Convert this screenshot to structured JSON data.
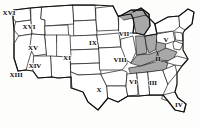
{
  "figure": {
    "kind": "map",
    "width": 200,
    "height": 127,
    "background_color": "#fdfdfb",
    "outline_color": "#111111",
    "state_fill_color": "#ffffff",
    "shaded_fill_color": "#a8a8a8",
    "label_color": "#0c0c0c"
  },
  "regions": [
    {
      "id": "region-2",
      "label": "II",
      "x": 158,
      "y": 59,
      "shaded": true,
      "area": "mid-atlantic"
    },
    {
      "id": "region-3",
      "label": "III",
      "x": 153,
      "y": 83,
      "shaded": false,
      "area": "southeast"
    },
    {
      "id": "region-4",
      "label": "IV",
      "x": 179,
      "y": 105,
      "shaded": false,
      "area": "florida"
    },
    {
      "id": "region-5",
      "label": "V",
      "x": 166,
      "y": 40,
      "shaded": false,
      "area": "northeast"
    },
    {
      "id": "region-6",
      "label": "VI",
      "x": 133,
      "y": 82,
      "shaded": false,
      "area": "lower-mississippi"
    },
    {
      "id": "region-7",
      "label": "VII",
      "x": 124,
      "y": 34,
      "shaded": false,
      "area": "upper-midwest"
    },
    {
      "id": "region-8",
      "label": "VIII",
      "x": 120,
      "y": 60,
      "shaded": false,
      "area": "central-midwest"
    },
    {
      "id": "region-9",
      "label": "IX",
      "x": 93,
      "y": 43,
      "shaded": false,
      "area": "northern-plains"
    },
    {
      "id": "region-10",
      "label": "X",
      "x": 99,
      "y": 90,
      "shaded": false,
      "area": "southern-plains"
    },
    {
      "id": "region-11",
      "label": "XI",
      "x": 67,
      "y": 58,
      "shaded": false,
      "area": "central-rockies"
    },
    {
      "id": "region-13",
      "label": "XIII",
      "x": 16,
      "y": 75,
      "shaded": false,
      "area": "southern-california"
    },
    {
      "id": "region-14",
      "label": "XIV",
      "x": 35,
      "y": 66,
      "shaded": false,
      "area": "desert-southwest"
    },
    {
      "id": "region-15",
      "label": "XV",
      "x": 33,
      "y": 48,
      "shaded": false,
      "area": "great-basin"
    },
    {
      "id": "region-16",
      "label": "XVI",
      "x": 29,
      "y": 27,
      "shaded": false,
      "area": "northern-rockies"
    },
    {
      "id": "region-16b",
      "label": "XVI",
      "x": 9,
      "y": 13,
      "shaded": false,
      "area": "pacific-northwest"
    }
  ],
  "shaded_states": [
    {
      "id": "shaded-michigan",
      "name": "Michigan"
    },
    {
      "id": "shaded-ohio",
      "name": "Ohio"
    },
    {
      "id": "shaded-indiana",
      "name": "Indiana"
    },
    {
      "id": "shaded-kentucky",
      "name": "Kentucky"
    },
    {
      "id": "shaded-west-virginia",
      "name": "West Virginia"
    },
    {
      "id": "shaded-virginia",
      "name": "Virginia"
    },
    {
      "id": "shaded-tennessee",
      "name": "Tennessee"
    }
  ]
}
